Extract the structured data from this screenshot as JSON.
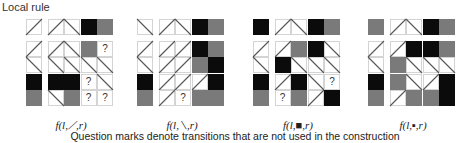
{
  "title": "Local rule",
  "caption": "Question marks denote transitions that are not used in the construction",
  "colors": {
    "black": "#0b0b0b",
    "gray": "#7a7a7a",
    "grid_line": "#d4d4d4",
    "diagonal": "#555555"
  },
  "legend": {
    "u": "diagonal up-right (/)",
    "d": "diagonal down-right (\\)",
    "B": "black square",
    "G": "gray square",
    "?": "unused transition",
    "": "empty"
  },
  "panels": [
    {
      "label": "f(l,⟋,r)",
      "x": 26,
      "rows": [
        [
          "u",
          "u",
          "d",
          "B",
          "G"
        ],
        [
          "u",
          "u",
          "d",
          "G",
          "?"
        ],
        [
          "d",
          "d",
          "d",
          "d",
          "d"
        ],
        [
          "B",
          "B",
          "B",
          "?",
          "d"
        ],
        [
          "G",
          "d",
          "G",
          "?",
          "?"
        ]
      ]
    },
    {
      "label": "f(l,⟍,r)",
      "x": 137,
      "rows": [
        [
          "d",
          "u",
          "d",
          "B",
          "G"
        ],
        [
          "u",
          "u",
          "u",
          "B",
          "G"
        ],
        [
          "d",
          "u",
          "u",
          "G",
          "B"
        ],
        [
          "B",
          "u",
          "u",
          "u",
          "B"
        ],
        [
          "G",
          "u",
          "?",
          "G",
          "G"
        ]
      ]
    },
    {
      "label": "f(l,■,r)",
      "x": 253,
      "rows": [
        [
          "B",
          "u",
          "d",
          "B",
          "G"
        ],
        [
          "u",
          "u",
          "G",
          "B",
          "d"
        ],
        [
          "d",
          "B",
          "d",
          "d",
          "d"
        ],
        [
          "B",
          "u",
          "B",
          "d",
          "?"
        ],
        [
          "G",
          "?",
          "G",
          "u",
          "B"
        ]
      ]
    },
    {
      "label": "f(l,▪,r)",
      "x": 368,
      "rows": [
        [
          "G",
          "u",
          "d",
          "B",
          "G"
        ],
        [
          "u",
          "u",
          "B",
          "B",
          "G"
        ],
        [
          "d",
          "G",
          "d",
          "d",
          "d"
        ],
        [
          "B",
          "G",
          "d",
          "u",
          "B"
        ],
        [
          "G",
          "u",
          "G",
          "G",
          "B"
        ]
      ]
    }
  ]
}
